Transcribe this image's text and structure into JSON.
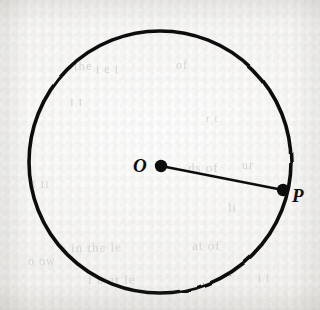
{
  "figure": {
    "kind": "geometry-diagram",
    "background_color": "#f6f5f3",
    "ink_color": "#111111",
    "canvas": {
      "width": 320,
      "height": 310
    }
  },
  "circle": {
    "name": "circle-outline",
    "center_x": 160,
    "center_y": 162,
    "radius": 131,
    "stroke_color": "#111111",
    "stroke_width": 3.6
  },
  "center_point": {
    "label": "O",
    "x": 161,
    "y": 166,
    "dot_radius": 6.2,
    "fill_color": "#111111",
    "label_x": 140,
    "label_y": 166
  },
  "circumference_point": {
    "label": "P",
    "x": 283,
    "y": 190,
    "dot_radius": 6.2,
    "fill_color": "#111111",
    "label_x": 299,
    "label_y": 195
  },
  "radius_segment": {
    "name": "radius-OP",
    "from_x": 161,
    "from_y": 166,
    "to_x": 283,
    "to_y": 190,
    "stroke_color": "#111111",
    "stroke_width": 2.6
  },
  "page_bleed": [
    {
      "text": "the",
      "x": 74,
      "y": 58,
      "size": 13,
      "rotate": -1
    },
    {
      "text": "i e i",
      "x": 96,
      "y": 62,
      "size": 12,
      "rotate": 0
    },
    {
      "text": "of",
      "x": 176,
      "y": 58,
      "size": 12,
      "rotate": 0
    },
    {
      "text": "I  I",
      "x": 70,
      "y": 96,
      "size": 11,
      "rotate": 0
    },
    {
      "text": "r  t",
      "x": 206,
      "y": 112,
      "size": 11,
      "rotate": 0
    },
    {
      "text": "ds  of",
      "x": 188,
      "y": 160,
      "size": 13,
      "rotate": 0
    },
    {
      "text": "ur",
      "x": 242,
      "y": 158,
      "size": 12,
      "rotate": 0
    },
    {
      "text": "li",
      "x": 228,
      "y": 200,
      "size": 13,
      "rotate": 0
    },
    {
      "text": "e  in  the  le",
      "x": 60,
      "y": 240,
      "size": 13,
      "rotate": -1
    },
    {
      "text": "at  of",
      "x": 192,
      "y": 238,
      "size": 13,
      "rotate": 0
    },
    {
      "text": "o  ow",
      "x": 28,
      "y": 254,
      "size": 12,
      "rotate": 0
    },
    {
      "text": "f  a  at  le",
      "x": 88,
      "y": 272,
      "size": 13,
      "rotate": 0
    },
    {
      "text": "I  II",
      "x": 32,
      "y": 178,
      "size": 11,
      "rotate": 0
    },
    {
      "text": "i l",
      "x": 258,
      "y": 272,
      "size": 11,
      "rotate": 0
    }
  ]
}
